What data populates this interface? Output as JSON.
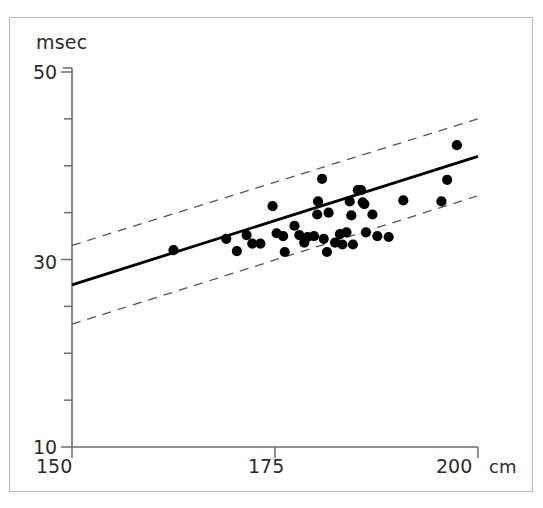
{
  "chart_data": {
    "type": "scatter",
    "title": "",
    "subtitle": "",
    "xlabel": "cm",
    "ylabel": "msec",
    "xlim": [
      150,
      200
    ],
    "ylim": [
      10,
      50
    ],
    "grid": false,
    "legend": null,
    "x_ticks": [
      {
        "value": 150,
        "label": "150"
      },
      {
        "value": 175,
        "label": "175"
      },
      {
        "value": 200,
        "label": "200"
      }
    ],
    "x_minor_ticks": [
      150,
      175,
      200
    ],
    "y_ticks": [
      {
        "value": 50,
        "label": "50"
      },
      {
        "value": 45,
        "label": ""
      },
      {
        "value": 40,
        "label": ""
      },
      {
        "value": 35,
        "label": ""
      },
      {
        "value": 30,
        "label": "30"
      },
      {
        "value": 25,
        "label": ""
      },
      {
        "value": 20,
        "label": ""
      },
      {
        "value": 15,
        "label": ""
      },
      {
        "value": 10,
        "label": "10"
      }
    ],
    "points": [
      {
        "x": 162.5,
        "y": 31.0
      },
      {
        "x": 169.0,
        "y": 32.2
      },
      {
        "x": 171.5,
        "y": 32.6
      },
      {
        "x": 170.3,
        "y": 30.9
      },
      {
        "x": 172.2,
        "y": 31.7
      },
      {
        "x": 173.2,
        "y": 31.7
      },
      {
        "x": 174.7,
        "y": 35.7
      },
      {
        "x": 175.2,
        "y": 32.8
      },
      {
        "x": 176.0,
        "y": 32.5
      },
      {
        "x": 176.2,
        "y": 30.8
      },
      {
        "x": 177.4,
        "y": 33.6
      },
      {
        "x": 178.0,
        "y": 32.6
      },
      {
        "x": 178.6,
        "y": 31.8
      },
      {
        "x": 179.0,
        "y": 32.4
      },
      {
        "x": 179.8,
        "y": 32.5
      },
      {
        "x": 180.2,
        "y": 34.8
      },
      {
        "x": 180.3,
        "y": 36.2
      },
      {
        "x": 180.8,
        "y": 38.6
      },
      {
        "x": 181.0,
        "y": 32.2
      },
      {
        "x": 181.4,
        "y": 30.8
      },
      {
        "x": 181.6,
        "y": 35.0
      },
      {
        "x": 182.4,
        "y": 31.8
      },
      {
        "x": 183.0,
        "y": 32.7
      },
      {
        "x": 183.3,
        "y": 31.6
      },
      {
        "x": 183.8,
        "y": 32.9
      },
      {
        "x": 184.2,
        "y": 36.2
      },
      {
        "x": 184.4,
        "y": 34.7
      },
      {
        "x": 184.6,
        "y": 31.6
      },
      {
        "x": 185.2,
        "y": 37.4
      },
      {
        "x": 185.6,
        "y": 37.4
      },
      {
        "x": 185.8,
        "y": 36.1
      },
      {
        "x": 186.0,
        "y": 35.9
      },
      {
        "x": 186.2,
        "y": 32.9
      },
      {
        "x": 187.0,
        "y": 34.8
      },
      {
        "x": 187.6,
        "y": 32.5
      },
      {
        "x": 189.0,
        "y": 32.4
      },
      {
        "x": 190.8,
        "y": 36.3
      },
      {
        "x": 195.5,
        "y": 36.2
      },
      {
        "x": 196.2,
        "y": 38.5
      },
      {
        "x": 197.4,
        "y": 42.2
      }
    ],
    "series": [
      {
        "name": "regression-line",
        "style": "solid",
        "color": "#000000",
        "x": [
          150,
          200
        ],
        "y": [
          27.3,
          41.0
        ]
      },
      {
        "name": "upper-confidence-band",
        "style": "dashed",
        "color": "#555555",
        "x": [
          150,
          200
        ],
        "y": [
          31.5,
          45.0
        ]
      },
      {
        "name": "lower-confidence-band",
        "style": "dashed",
        "color": "#555555",
        "x": [
          150,
          200
        ],
        "y": [
          23.1,
          36.8
        ]
      }
    ]
  },
  "axes": {
    "y_title": "msec",
    "x_unit": "cm",
    "y_tick_labels": {
      "top": "50",
      "middle": "30",
      "bottom": "10"
    },
    "x_tick_labels": {
      "left": "150",
      "middle": "175",
      "right": "200"
    }
  },
  "colors": {
    "frame": "#b9b9b9",
    "axis": "#6d6d6d",
    "point": "#000000",
    "fit_line": "#000000",
    "band_line": "#555555",
    "text": "#2b2b2b",
    "background": "#ffffff"
  }
}
